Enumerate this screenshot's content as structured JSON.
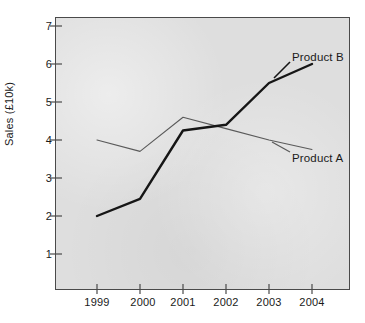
{
  "chart_data": {
    "type": "line",
    "title": "",
    "subtitle": "",
    "xlabel": "",
    "ylabel": "Sales  (£10k)",
    "categories": [
      "1999",
      "2000",
      "2001",
      "2002",
      "2003",
      "2004"
    ],
    "x": [
      1999,
      2000,
      2001,
      2002,
      2003,
      2004
    ],
    "ylim": [
      0,
      7.35
    ],
    "xlim": [
      1998.6,
      2004.9
    ],
    "yticks": [
      1,
      2,
      3,
      4,
      5,
      6,
      7
    ],
    "ytick_labels": [
      "1",
      "2",
      "3",
      "4",
      "5",
      "6",
      "7"
    ],
    "xticks": [
      1999,
      2000,
      2001,
      2002,
      2003,
      2004
    ],
    "xtick_labels": [
      "1999",
      "2000",
      "2001",
      "2002",
      "2003",
      "2004"
    ],
    "grid": false,
    "legend": "inline-annotations",
    "legend_position": "right-inline",
    "plot_background": "#dedede",
    "frame_color": "#4a4a4a",
    "series": [
      {
        "name": "Product A",
        "label": "Product A",
        "color": "#5a5a5a",
        "line_width": 1.1,
        "values": [
          4.0,
          3.7,
          4.6,
          4.3,
          4.0,
          3.75
        ]
      },
      {
        "name": "Product B",
        "label": "Product B",
        "color": "#161616",
        "line_width": 2.4,
        "values": [
          2.0,
          2.45,
          4.25,
          4.4,
          5.5,
          6.0
        ]
      }
    ],
    "annotations": [
      {
        "text": "Product B",
        "series": "Product B"
      },
      {
        "text": "Product A",
        "series": "Product A"
      }
    ]
  },
  "axis": {
    "y_tick_1": "1",
    "y_tick_2": "2",
    "y_tick_3": "3",
    "y_tick_4": "4",
    "y_tick_5": "5",
    "y_tick_6": "6",
    "y_tick_7": "7",
    "x_tick_1": "1999",
    "x_tick_2": "2000",
    "x_tick_3": "2001",
    "x_tick_4": "2002",
    "x_tick_5": "2003",
    "x_tick_6": "2004",
    "y_axis_title": "Sales  (£10k)"
  },
  "labels": {
    "product_b": "Product B",
    "product_a": "Product A"
  }
}
